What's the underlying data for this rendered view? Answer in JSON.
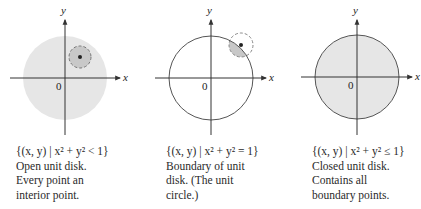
{
  "figure": {
    "colors": {
      "disk_fill": "#e6e6e6",
      "neighborhood_fill": "#c8c8c8",
      "stroke": "#555555",
      "axis": "#333333",
      "point": "#222222"
    },
    "panels": [
      {
        "id": "open-disk",
        "axes": {
          "x_label": "x",
          "y_label": "y",
          "origin_label": "0"
        },
        "set_notation": "{(x, y) | x² + y² < 1}",
        "description_lines": [
          "Open unit disk.",
          "Every point an",
          "interior point."
        ]
      },
      {
        "id": "unit-circle",
        "axes": {
          "x_label": "x",
          "y_label": "y",
          "origin_label": "0"
        },
        "set_notation": "{(x, y) | x² + y² = 1}",
        "description_lines": [
          "Boundary of unit",
          "disk. (The unit",
          "circle.)"
        ]
      },
      {
        "id": "closed-disk",
        "axes": {
          "x_label": "x",
          "y_label": "y",
          "origin_label": "0"
        },
        "set_notation": "{(x, y) | x² + y² ≤ 1}",
        "description_lines": [
          "Closed unit disk.",
          "Contains all",
          "boundary points."
        ]
      }
    ]
  }
}
